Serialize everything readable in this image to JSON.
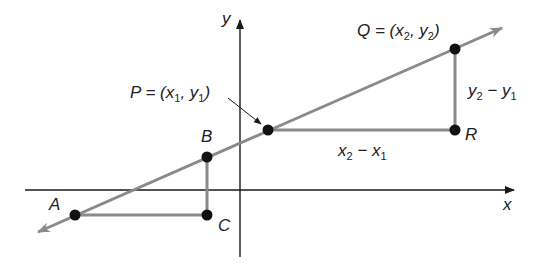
{
  "colors": {
    "axis": "#1a1a1a",
    "line": "#8a8a8a",
    "point": "#111111",
    "text": "#222222"
  },
  "axes": {
    "x_label": "x",
    "y_label": "y"
  },
  "points": {
    "A": {
      "label": "A"
    },
    "B": {
      "label": "B"
    },
    "C": {
      "label": "C"
    },
    "P": {
      "label": "P = (x",
      "sub1": "1",
      "mid": ", y",
      "sub2": "1",
      "end": ")"
    },
    "Q": {
      "label": "Q = (x",
      "sub1": "2",
      "mid": ", y",
      "sub2": "2",
      "end": ")"
    },
    "R": {
      "label": "R"
    }
  },
  "differences": {
    "horizontal": {
      "a": "x",
      "a_sub": "2",
      "op": " − x",
      "b_sub": "1"
    },
    "vertical": {
      "a": "y",
      "a_sub": "2",
      "op": " − y",
      "b_sub": "1"
    }
  }
}
